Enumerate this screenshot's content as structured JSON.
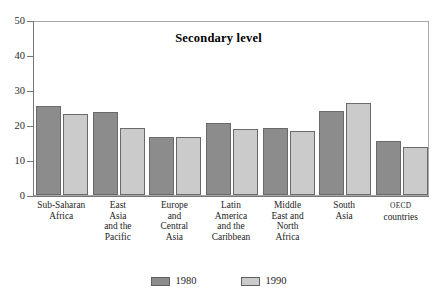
{
  "chart_data": {
    "type": "bar",
    "title": "Secondary level",
    "xlabel": "",
    "ylabel": "",
    "ylim": [
      0,
      50
    ],
    "yticks": [
      0,
      10,
      20,
      30,
      40,
      50
    ],
    "grid": false,
    "legend_position": "bottom",
    "categories": [
      "Sub-Saharan Africa",
      "East Asia and the Pacific",
      "Europe and Central Asia",
      "Latin America and the Caribbean",
      "Middle East and North Africa",
      "South Asia",
      "OECD countries"
    ],
    "category_lines": [
      [
        "Sub-Saharan",
        "Africa"
      ],
      [
        "East",
        "Asia",
        "and the",
        "Pacific"
      ],
      [
        "Europe",
        "and",
        "Central",
        "Asia"
      ],
      [
        "Latin",
        "America",
        "and the",
        "Caribbean"
      ],
      [
        "Middle",
        "East and",
        "North",
        "Africa"
      ],
      [
        "South",
        "Asia"
      ],
      [
        "OECD",
        "countries"
      ]
    ],
    "series": [
      {
        "name": "1980",
        "color": "#8c8c8c",
        "values": [
          25.4,
          23.6,
          16.6,
          20.5,
          19.2,
          24.0,
          15.4
        ]
      },
      {
        "name": "1990",
        "color": "#cbcbcb",
        "values": [
          23.2,
          19.1,
          16.6,
          19.0,
          18.2,
          26.4,
          13.8
        ]
      }
    ]
  },
  "legend": {
    "items": [
      {
        "label": "1980",
        "color": "#8c8c8c"
      },
      {
        "label": "1990",
        "color": "#cbcbcb"
      }
    ]
  },
  "axis": {
    "y_tick_labels": [
      "50",
      "40",
      "30",
      "20",
      "10",
      "0"
    ]
  }
}
